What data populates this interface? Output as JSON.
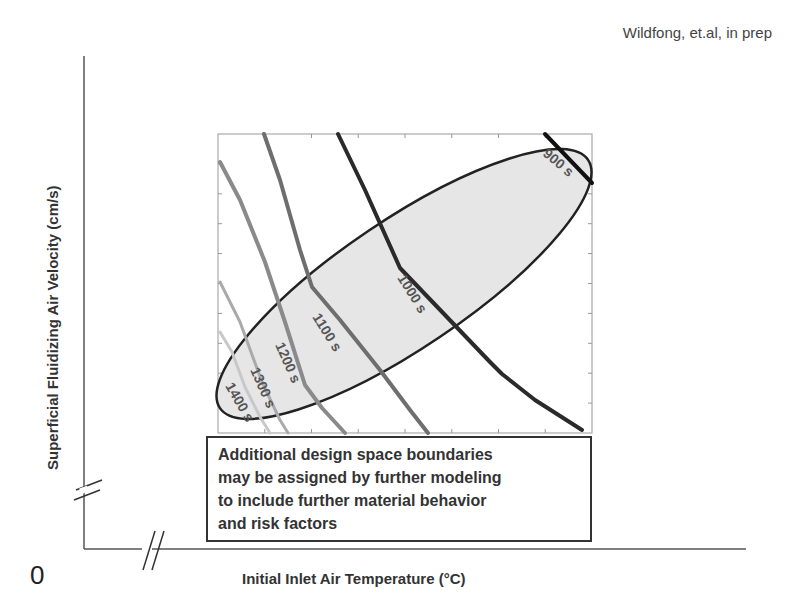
{
  "citation": "Wildfong, et.al, in prep",
  "axes": {
    "ylabel": "Superficial Fluidizing Air Velocity (cm/s)",
    "xlabel": "Initial Inlet Air Temperature (°C)",
    "origin_label": "0"
  },
  "note": {
    "lines": [
      "Additional design space boundaries",
      "may be assigned by further modeling",
      "to include further material behavior",
      "and risk factors"
    ]
  },
  "chart_data": {
    "type": "contour",
    "title": "",
    "xlabel": "Initial Inlet Air Temperature (°C)",
    "ylabel": "Superficial Fluidizing Air Velocity (cm/s)",
    "annotation": "Wildfong, et.al, in prep",
    "axis_breaks": [
      "x",
      "y"
    ],
    "origin": "0",
    "plot_box_px": {
      "x0": 218,
      "y0": 134,
      "x1": 592,
      "y1": 433
    },
    "contours": [
      {
        "label": "900 s",
        "color": "#111111",
        "width": 4,
        "points": [
          [
            545,
            134
          ],
          [
            592,
            183
          ]
        ]
      },
      {
        "label": "1000 s",
        "color": "#2a2a2a",
        "width": 4,
        "points": [
          [
            338,
            134
          ],
          [
            365,
            190
          ],
          [
            400,
            268
          ],
          [
            445,
            315
          ],
          [
            490,
            362
          ],
          [
            502,
            374
          ],
          [
            535,
            400
          ],
          [
            582,
            430
          ]
        ]
      },
      {
        "label": "1100 s",
        "color": "#6e6e6e",
        "width": 4,
        "points": [
          [
            264,
            134
          ],
          [
            280,
            180
          ],
          [
            300,
            250
          ],
          [
            312,
            287
          ],
          [
            340,
            320
          ],
          [
            380,
            370
          ],
          [
            410,
            410
          ],
          [
            428,
            433
          ]
        ]
      },
      {
        "label": "1200 s",
        "color": "#8a8a8a",
        "width": 4,
        "points": [
          [
            220,
            162
          ],
          [
            240,
            200
          ],
          [
            265,
            262
          ],
          [
            285,
            322
          ],
          [
            305,
            385
          ],
          [
            322,
            408
          ],
          [
            345,
            433
          ]
        ]
      },
      {
        "label": "1300 s",
        "color": "#aaaaaa",
        "width": 3,
        "points": [
          [
            220,
            282
          ],
          [
            240,
            322
          ],
          [
            262,
            382
          ],
          [
            280,
            420
          ],
          [
            288,
            433
          ]
        ]
      },
      {
        "label": "1400 s",
        "color": "#c8c8c8",
        "width": 3,
        "points": [
          [
            220,
            332
          ],
          [
            232,
            352
          ],
          [
            245,
            387
          ],
          [
            260,
            417
          ],
          [
            270,
            433
          ]
        ]
      }
    ],
    "design_space_ellipse": {
      "cx": 404,
      "cy": 284,
      "rx": 222,
      "ry": 64,
      "rotation_deg": -34,
      "fill": "#e6e6e6",
      "stroke": "#222222"
    }
  }
}
